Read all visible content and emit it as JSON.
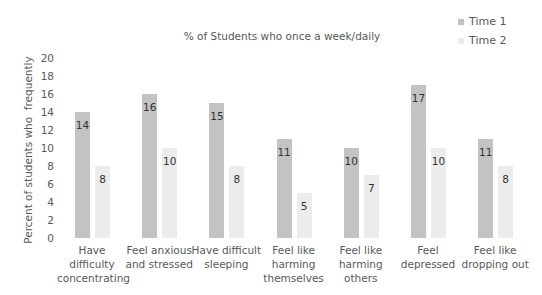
{
  "chart_data": {
    "type": "bar",
    "title": "% of Students who once a week/daily",
    "xlabel": "",
    "ylabel": "Percent of students who  frequently",
    "ylim": [
      0,
      20
    ],
    "yticks": [
      0,
      2,
      4,
      6,
      8,
      10,
      12,
      14,
      16,
      18,
      20
    ],
    "grid": false,
    "legend_position": "top-right",
    "categories": [
      "Have difficulty concentrating",
      "Feel anxious and stressed",
      "Have difficult sleeping",
      "Feel like harming themselves",
      "Feel like harming others",
      "Feel depressed",
      "Feel like dropping out"
    ],
    "category_lines": [
      [
        "Have",
        "difficulty",
        "concentrating"
      ],
      [
        "Feel anxious",
        "and stressed"
      ],
      [
        "Have difficult",
        "sleeping"
      ],
      [
        "Feel like",
        "harming",
        "themselves"
      ],
      [
        "Feel like",
        "harming",
        "others"
      ],
      [
        "Feel",
        "depressed"
      ],
      [
        "Feel like",
        "dropping out"
      ]
    ],
    "series": [
      {
        "name": "Time 1",
        "color": "#c3c3c3",
        "values": [
          14,
          16,
          15,
          11,
          10,
          17,
          11
        ]
      },
      {
        "name": "Time 2",
        "color": "#ececec",
        "values": [
          8,
          10,
          8,
          5,
          7,
          10,
          8
        ]
      }
    ]
  }
}
